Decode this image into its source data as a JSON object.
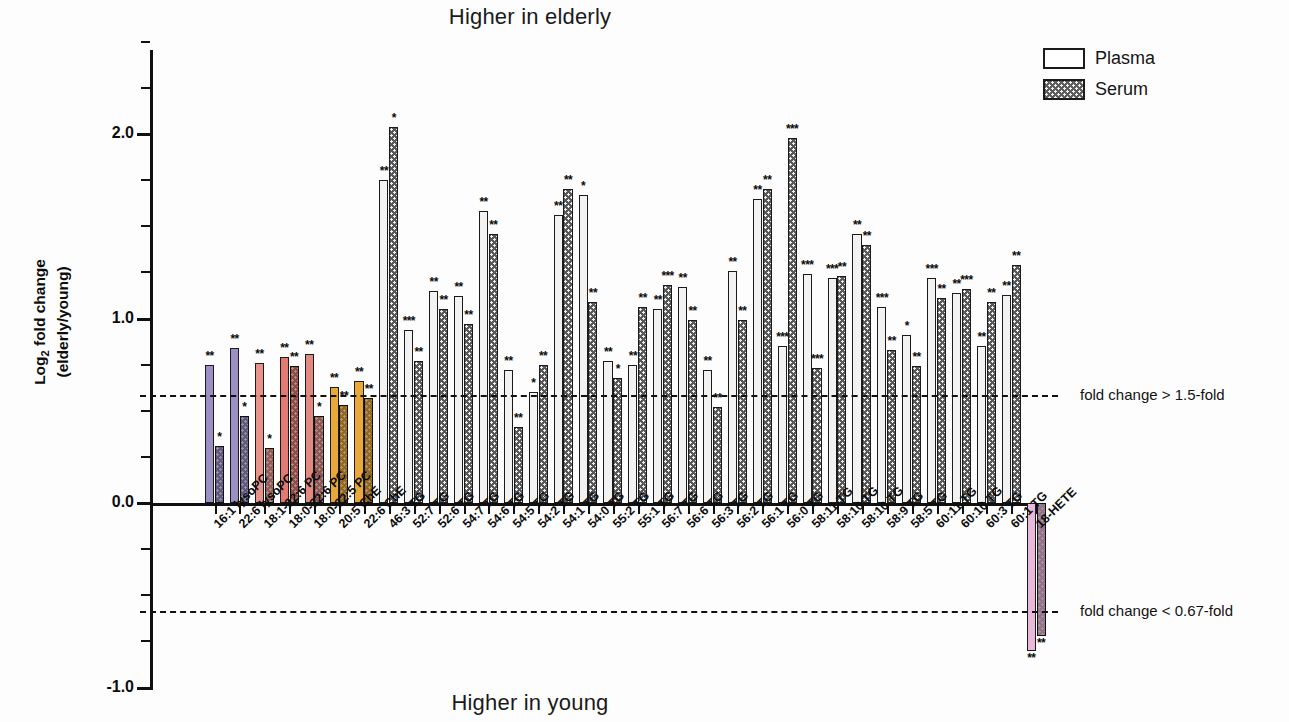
{
  "titles": {
    "top": "Higher in elderly",
    "bottom": "Higher in young"
  },
  "axes": {
    "ylabel_line1": "Log",
    "ylabel_sub": "2",
    "ylabel_line1b": " fold change",
    "ylabel_line2": "(elderly/young)",
    "y_ticks": [
      "2.0",
      "1.0",
      "0.0",
      "-1.0"
    ],
    "y_min": -1.0,
    "y_max": 2.5
  },
  "legend": {
    "position": "top-right",
    "items": [
      {
        "label": "Plasma",
        "pattern": "open-white"
      },
      {
        "label": "Serum",
        "pattern": "dotted-dark"
      }
    ]
  },
  "thresholds": [
    {
      "value": 0.585,
      "label": "fold change > 1.5-fold"
    },
    {
      "value": -0.585,
      "label": "fold change < 0.67-fold"
    }
  ],
  "chart_data": {
    "type": "bar",
    "title": "Higher in elderly",
    "subtitle": "Higher in young",
    "xlabel": "",
    "ylabel": "Log2 fold change (elderly/young)",
    "ylim": [
      -1.0,
      2.5
    ],
    "yticks": [
      2.0,
      1.0,
      0.0,
      -1.0
    ],
    "grid": false,
    "legend": [
      "Plasma",
      "Serum"
    ],
    "annotations": [
      "fold change > 1.5-fold",
      "fold change < 0.67-fold"
    ],
    "categories": [
      "16:1 lysoPC",
      "22:6 lysoPC",
      "18:1-22:6 PC",
      "18:0-22:6 PC",
      "18:0-22:5 PC",
      "20:5 ChE",
      "22:6 ChE",
      "46:3 TG",
      "52:7 TG",
      "52:6 TG",
      "54:7 TG",
      "54:6 TG",
      "54:5 TG",
      "54:2 TG",
      "54:1 TG",
      "54:0 TG",
      "55:2 TG",
      "55:1 TG",
      "56:7 TG",
      "56:6 TG",
      "56:3 TG",
      "56:2 TG",
      "56:1 TG",
      "56:0 TG",
      "58:11 TG",
      "58:10 TG",
      "58:10 TG",
      "58:9 TG",
      "58:5 TG",
      "60:11 TG",
      "60:10 TG",
      "60:3 TG",
      "60:1 TG",
      "18-HETE"
    ],
    "series": [
      {
        "name": "Plasma",
        "values": [
          0.75,
          0.84,
          0.76,
          0.79,
          0.81,
          0.63,
          0.66,
          1.75,
          0.94,
          1.15,
          1.12,
          1.58,
          0.72,
          0.6,
          1.56,
          1.67,
          0.77,
          0.75,
          1.05,
          1.17,
          0.72,
          1.26,
          1.65,
          0.85,
          1.24,
          1.22,
          1.46,
          1.06,
          0.91,
          1.22,
          1.14,
          0.85,
          1.13,
          -0.8
        ]
      },
      {
        "name": "Serum",
        "values": [
          0.31,
          0.47,
          0.3,
          0.74,
          0.47,
          0.53,
          0.57,
          2.04,
          0.77,
          1.05,
          0.97,
          1.46,
          0.41,
          0.75,
          1.7,
          1.09,
          0.68,
          1.06,
          1.18,
          0.99,
          0.52,
          0.99,
          1.7,
          1.98,
          0.73,
          1.23,
          1.4,
          0.83,
          0.74,
          1.11,
          1.16,
          1.09,
          1.29,
          -0.72
        ]
      }
    ],
    "significance": [
      {
        "plasma": "**",
        "serum": "*"
      },
      {
        "plasma": "**",
        "serum": "*"
      },
      {
        "plasma": "**",
        "serum": "*"
      },
      {
        "plasma": "**",
        "serum": "**"
      },
      {
        "plasma": "**",
        "serum": "*"
      },
      {
        "plasma": "**",
        "serum": "**"
      },
      {
        "plasma": "**",
        "serum": "**"
      },
      {
        "plasma": "**",
        "serum": "*"
      },
      {
        "plasma": "***",
        "serum": "**"
      },
      {
        "plasma": "**",
        "serum": "**"
      },
      {
        "plasma": "**",
        "serum": "**"
      },
      {
        "plasma": "**",
        "serum": "**"
      },
      {
        "plasma": "**",
        "serum": "**"
      },
      {
        "plasma": "*",
        "serum": "**"
      },
      {
        "plasma": "**",
        "serum": "**"
      },
      {
        "plasma": "*",
        "serum": "**"
      },
      {
        "plasma": "**",
        "serum": "*"
      },
      {
        "plasma": "**",
        "serum": "**"
      },
      {
        "plasma": "**",
        "serum": "***"
      },
      {
        "plasma": "**",
        "serum": "**"
      },
      {
        "plasma": "**",
        "serum": "**"
      },
      {
        "plasma": "**",
        "serum": "**"
      },
      {
        "plasma": "**",
        "serum": "**"
      },
      {
        "plasma": "***",
        "serum": "***"
      },
      {
        "plasma": "***",
        "serum": "***"
      },
      {
        "plasma": "***",
        "serum": "**"
      },
      {
        "plasma": "**",
        "serum": "**"
      },
      {
        "plasma": "***",
        "serum": "**"
      },
      {
        "plasma": "*",
        "serum": "**"
      },
      {
        "plasma": "***",
        "serum": "**"
      },
      {
        "plasma": "**",
        "serum": "***"
      },
      {
        "plasma": "**",
        "serum": "**"
      },
      {
        "plasma": "**",
        "serum": "**"
      },
      {
        "plasma": "**",
        "serum": "**"
      }
    ],
    "colors": [
      "#9b8fc4",
      "#9b8fc4",
      "#e8928a",
      "#e07a72",
      "#e08a82",
      "#e8a83a",
      "#e8a83a",
      null,
      null,
      null,
      null,
      null,
      null,
      null,
      null,
      null,
      null,
      null,
      null,
      null,
      null,
      null,
      null,
      null,
      null,
      null,
      null,
      null,
      null,
      null,
      null,
      null,
      null,
      "#e8b9d8"
    ]
  }
}
